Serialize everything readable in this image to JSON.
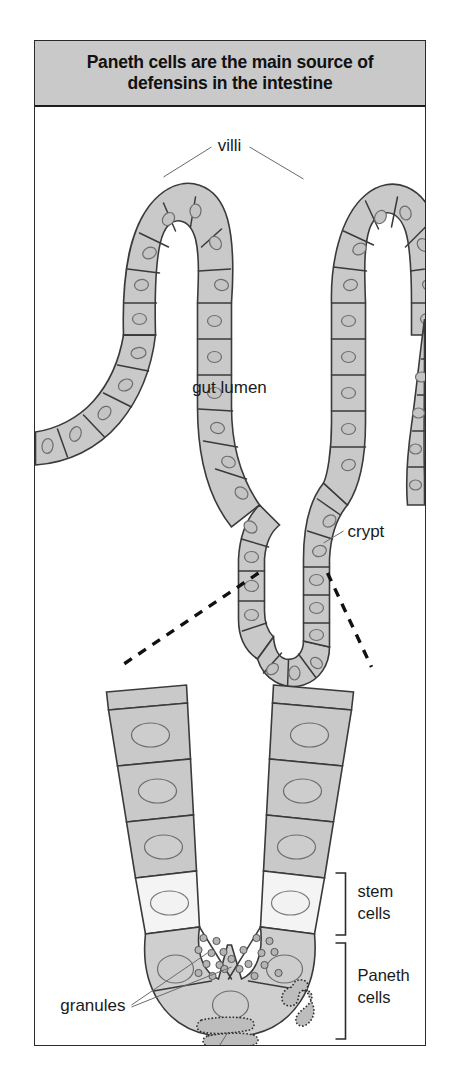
{
  "figure": {
    "title": "Paneth cells are the main source of defensins in the intestine",
    "title_line1": "Paneth cells are the main source of",
    "title_line2": "defensins in the intestine",
    "border_color": "#2a2a2a",
    "title_bar_color": "#c9c9c9",
    "background_color": "#ffffff"
  },
  "labels": {
    "villi": "villi",
    "gut_lumen": "gut lumen",
    "crypt": "crypt",
    "stem_cells_line1": "stem",
    "stem_cells_line2": "cells",
    "paneth_cells_line1": "Paneth",
    "paneth_cells_line2": "cells",
    "granules": "granules",
    "rough_er": "rough endoplasmic reticulum"
  },
  "colors": {
    "epithelium_fill": "#c9c9c9",
    "stem_cell_fill": "#f4f4f4",
    "paneth_cell_fill": "#cfcfcf",
    "nucleus_fill": "#c4c4c4",
    "granule_fill": "#b4b4b4",
    "outline": "#3a3a3a",
    "dashed_guide": "#111111"
  },
  "diagram_content": {
    "type": "biological-illustration",
    "subject": "intestinal villi and crypt of Lieberkuhn with Paneth cells",
    "upper_panel": {
      "description": "Cross-section of intestinal mucosa showing two villi flanking the gut lumen, converging into a crypt",
      "structures": [
        "villus-left",
        "villus-right",
        "gut-lumen",
        "crypt"
      ],
      "cell_count_per_villus": 14
    },
    "lower_panel": {
      "description": "Magnified view of crypt base showing columnar cells, stem cells and Paneth cells",
      "cell_types": [
        {
          "name": "columnar epithelial cells",
          "fill": "#c9c9c9",
          "position": "upper crypt"
        },
        {
          "name": "stem cells",
          "fill": "#f4f4f4",
          "position": "mid crypt"
        },
        {
          "name": "Paneth cells",
          "fill": "#cfcfcf",
          "position": "crypt base",
          "organelles": [
            "granules",
            "rough endoplasmic reticulum"
          ]
        }
      ]
    }
  }
}
